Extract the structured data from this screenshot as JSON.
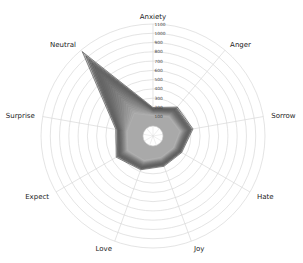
{
  "chart_data": {
    "type": "radar",
    "title": "",
    "axes": [
      "Anxiety",
      "Anger",
      "Sorrow",
      "Hate",
      "Joy",
      "Love",
      "Expect",
      "Surprise",
      "Neutral"
    ],
    "rlim": [
      0,
      1100
    ],
    "rticks": [
      100,
      200,
      300,
      400,
      500,
      600,
      700,
      800,
      900,
      1000,
      1100
    ],
    "grid": true,
    "legend": "none",
    "series_color_range": [
      "#555555",
      "#bbbbbb"
    ],
    "series_count_estimate": 20,
    "envelope_max": {
      "Anxiety": 200,
      "Anger": 300,
      "Sorrow": 330,
      "Hate": 250,
      "Joy": 240,
      "Love": 280,
      "Expect": 350,
      "Surprise": 300,
      "Neutral": 1080
    },
    "series": [
      {
        "name": "s1",
        "values": [
          200,
          300,
          330,
          250,
          240,
          280,
          350,
          300,
          1080
        ]
      },
      {
        "name": "s2",
        "values": [
          190,
          285,
          315,
          240,
          230,
          270,
          335,
          285,
          1020
        ]
      },
      {
        "name": "s3",
        "values": [
          185,
          275,
          305,
          232,
          222,
          262,
          325,
          278,
          970
        ]
      },
      {
        "name": "s4",
        "values": [
          180,
          265,
          295,
          225,
          215,
          255,
          315,
          270,
          920
        ]
      },
      {
        "name": "s5",
        "values": [
          175,
          255,
          285,
          218,
          208,
          248,
          305,
          262,
          870
        ]
      },
      {
        "name": "s6",
        "values": [
          170,
          248,
          278,
          212,
          202,
          242,
          298,
          255,
          820
        ]
      },
      {
        "name": "s7",
        "values": [
          165,
          240,
          270,
          206,
          196,
          236,
          290,
          248,
          770
        ]
      },
      {
        "name": "s8",
        "values": [
          160,
          232,
          262,
          200,
          190,
          230,
          282,
          242,
          720
        ]
      },
      {
        "name": "s9",
        "values": [
          156,
          225,
          255,
          195,
          185,
          224,
          275,
          236,
          670
        ]
      },
      {
        "name": "s10",
        "values": [
          152,
          218,
          248,
          190,
          180,
          218,
          268,
          230,
          620
        ]
      },
      {
        "name": "s11",
        "values": [
          148,
          212,
          241,
          185,
          175,
          213,
          261,
          224,
          570
        ]
      },
      {
        "name": "s12",
        "values": [
          144,
          206,
          235,
          180,
          170,
          208,
          255,
          218,
          520
        ]
      },
      {
        "name": "s13",
        "values": [
          140,
          200,
          228,
          175,
          166,
          203,
          248,
          212,
          470
        ]
      },
      {
        "name": "s14",
        "values": [
          136,
          194,
          222,
          170,
          162,
          198,
          242,
          206,
          420
        ]
      },
      {
        "name": "s15",
        "values": [
          132,
          188,
          216,
          166,
          158,
          193,
          236,
          200,
          380
        ]
      },
      {
        "name": "s16",
        "values": [
          128,
          182,
          210,
          162,
          154,
          188,
          230,
          195,
          340
        ]
      },
      {
        "name": "s17",
        "values": [
          124,
          176,
          204,
          158,
          150,
          184,
          224,
          190,
          300
        ]
      },
      {
        "name": "s18",
        "values": [
          120,
          170,
          198,
          154,
          146,
          180,
          218,
          185,
          265
        ]
      },
      {
        "name": "s19",
        "values": [
          116,
          165,
          192,
          150,
          142,
          176,
          212,
          180,
          235
        ]
      },
      {
        "name": "s20",
        "values": [
          112,
          160,
          186,
          146,
          138,
          172,
          206,
          175,
          210
        ]
      }
    ]
  }
}
